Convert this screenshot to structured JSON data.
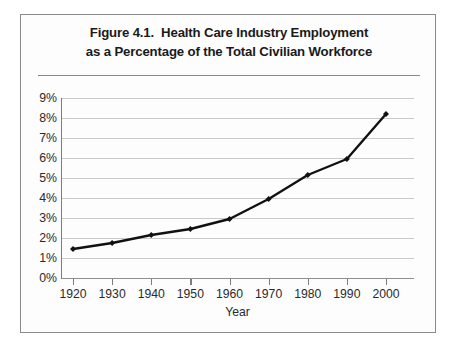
{
  "figure": {
    "title_line1": "Figure 4.1.  Health Care Industry Employment",
    "title_line2": "as a Percentage of the Total Civilian Workforce",
    "border_color": "#8b8b8b",
    "background": "#fdfdfd"
  },
  "chart_data": {
    "type": "line",
    "title": "Figure 4.1.  Health Care Industry Employment as a Percentage of the Total Civilian Workforce",
    "xlabel": "Year",
    "ylabel": "",
    "x": [
      1920,
      1930,
      1940,
      1950,
      1960,
      1970,
      1980,
      1990,
      2000
    ],
    "categories": [
      "1920",
      "1930",
      "1940",
      "1950",
      "1960",
      "1970",
      "1980",
      "1990",
      "2000"
    ],
    "values": [
      1.45,
      1.75,
      2.15,
      2.45,
      2.95,
      3.95,
      5.15,
      5.95,
      8.2
    ],
    "series": [
      {
        "name": "Health care industry employment as % of total civilian workforce",
        "values": [
          1.45,
          1.75,
          2.15,
          2.45,
          2.95,
          3.95,
          5.15,
          5.95,
          8.2
        ]
      }
    ],
    "ylim": [
      0,
      9
    ],
    "xlim": [
      1920,
      2000
    ],
    "ytick_labels": [
      "0%",
      "1%",
      "2%",
      "3%",
      "4%",
      "5%",
      "6%",
      "7%",
      "8%",
      "9%"
    ],
    "ytick_values": [
      0,
      1,
      2,
      3,
      4,
      5,
      6,
      7,
      8,
      9
    ],
    "xtick_labels": [
      "1920",
      "1930",
      "1940",
      "1950",
      "1960",
      "1970",
      "1980",
      "1990",
      "2000"
    ],
    "grid": "horizontal",
    "legend": "none",
    "line_color": "#111111",
    "marker": "diamond",
    "marker_color": "#111111",
    "gridline_color": "#c9c9c9",
    "axis_color": "#7d7d7d"
  }
}
